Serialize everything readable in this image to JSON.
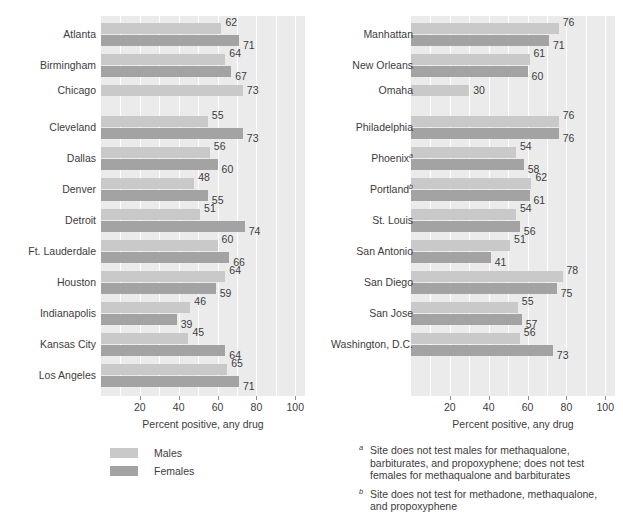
{
  "chart_data": {
    "type": "bar",
    "orientation": "horizontal",
    "title": "",
    "xlabel": "Percent positive, any drug",
    "ylabel": "",
    "xlim": [
      0,
      105
    ],
    "xticks": [
      20,
      40,
      60,
      80,
      100
    ],
    "xtick_labels": [
      "20",
      "40",
      "60",
      "80",
      "100"
    ],
    "grid": true,
    "grid_axis": "x",
    "grid_interval": 10,
    "legend_position": "below-left",
    "series": [
      {
        "name": "Males",
        "color": "#c9c9c9"
      },
      {
        "name": "Females",
        "color": "#a3a3a3"
      }
    ],
    "panels": [
      {
        "id": "panel-left",
        "categories": [
          "Atlanta",
          "Birmingham",
          "Chicago",
          "Cleveland",
          "Dallas",
          "Denver",
          "Detroit",
          "Ft. Lauderdale",
          "Houston",
          "Indianapolis",
          "Kansas City",
          "Los Angeles"
        ],
        "footnote_markers": [
          "",
          "",
          "",
          "",
          "",
          "",
          "",
          "",
          "",
          "",
          "",
          ""
        ],
        "males": [
          62,
          64,
          73,
          55,
          56,
          48,
          51,
          60,
          64,
          46,
          45,
          65
        ],
        "females": [
          71,
          67,
          null,
          73,
          60,
          55,
          74,
          66,
          59,
          39,
          64,
          71
        ]
      },
      {
        "id": "panel-right",
        "categories": [
          "Manhattan",
          "New Orleans",
          "Omaha",
          "Philadelphia",
          "Phoenix",
          "Portland",
          "St. Louis",
          "San Antonio",
          "San Diego",
          "San Jose",
          "Washington, D.C."
        ],
        "footnote_markers": [
          "",
          "",
          "",
          "",
          "a",
          "b",
          "",
          "",
          "",
          "",
          ""
        ],
        "males": [
          76,
          61,
          30,
          76,
          54,
          62,
          54,
          51,
          78,
          55,
          56
        ],
        "females": [
          71,
          60,
          null,
          76,
          58,
          61,
          56,
          41,
          75,
          57,
          73
        ]
      }
    ]
  },
  "legend": {
    "items": [
      {
        "label": "Males",
        "color": "#c9c9c9"
      },
      {
        "label": "Females",
        "color": "#a3a3a3"
      }
    ]
  },
  "footnotes": [
    {
      "marker": "a",
      "text": "Site does not test males for methaqualone, barbiturates, and propoxyphene; does not test females for methaqualone and barbiturates"
    },
    {
      "marker": "b",
      "text": "Site does not test for methadone, methaqualone, and propoxyphene"
    }
  ],
  "axis": {
    "title_left": "Percent positive, any drug",
    "title_right": "Percent positive, any drug"
  }
}
